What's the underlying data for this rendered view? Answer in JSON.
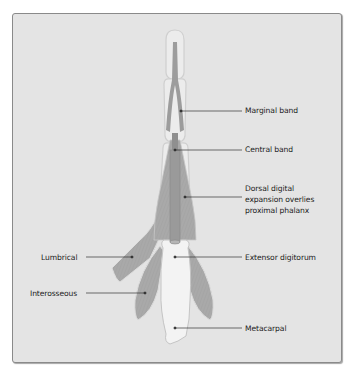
{
  "figure": {
    "colors": {
      "panel_background": "#e4e4e4",
      "panel_border": "#8a8a8a",
      "muscle_fill": "#a9a9a9",
      "bone_fill": "#f2f2f2",
      "bone_outline": "#c4c4c4",
      "leader_line": "#333333"
    },
    "labels": {
      "marginal_band": "Marginal band",
      "central_band": "Central band",
      "dorsal_line1": "Dorsal digital",
      "dorsal_line2": "expansion overlies",
      "dorsal_line3": "proximal phalanx",
      "extensor_digitorum": "Extensor digitorum",
      "lumbrical": "Lumbrical",
      "interosseous": "Interosseous",
      "metacarpal": "Metacarpal"
    }
  }
}
